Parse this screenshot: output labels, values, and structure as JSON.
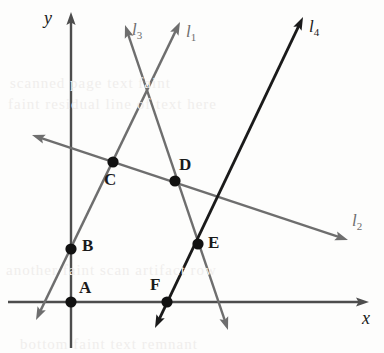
{
  "figure": {
    "width": 384,
    "height": 353,
    "background": "#fdfdfc"
  },
  "colors": {
    "axis": "#4d4d4d",
    "gray_line": "#6e6e6e",
    "black_line": "#1a1a1a",
    "point_fill": "#111111",
    "label_text": "#1a1a1a",
    "gray_label_text": "#6e6e6e",
    "background_noise": "#f0eeec"
  },
  "axes": {
    "x": {
      "label": "x",
      "label_x": 362,
      "label_y": 308,
      "y_pixel": 302,
      "x_start": 8,
      "x_end": 369
    },
    "y": {
      "label": "y",
      "label_x": 44,
      "label_y": 8,
      "x_pixel": 71,
      "y_start": 12,
      "y_end": 348
    }
  },
  "points": [
    {
      "name": "A",
      "cx": 71,
      "cy": 302,
      "label": "A",
      "label_x": 79,
      "label_y": 278
    },
    {
      "name": "B",
      "cx": 71,
      "cy": 249,
      "label": "B",
      "label_x": 82,
      "label_y": 236
    },
    {
      "name": "C",
      "cx": 113,
      "cy": 162,
      "label": "C",
      "label_x": 104,
      "label_y": 170
    },
    {
      "name": "D",
      "cx": 175,
      "cy": 181,
      "label": "D",
      "label_x": 179,
      "label_y": 155
    },
    {
      "name": "E",
      "cx": 198,
      "cy": 244,
      "label": "E",
      "label_x": 208,
      "label_y": 233
    },
    {
      "name": "F",
      "cx": 167,
      "cy": 302,
      "label": "F",
      "label_x": 150,
      "label_y": 275
    }
  ],
  "lines": [
    {
      "name": "l1",
      "label": "l",
      "subscript": "1",
      "color": "#6e6e6e",
      "style": "gray",
      "arrows": "both",
      "x1": 36,
      "y1": 320,
      "x2": 180,
      "y2": 22,
      "label_x": 186,
      "label_y": 22,
      "passes_through": [
        "A",
        "B",
        "C"
      ]
    },
    {
      "name": "l2",
      "label": "l",
      "subscript": "2",
      "color": "#6e6e6e",
      "style": "gray",
      "arrows": "both",
      "x1": 32,
      "y1": 135,
      "x2": 348,
      "y2": 240,
      "label_x": 352,
      "label_y": 211,
      "passes_through": [
        "C",
        "D"
      ]
    },
    {
      "name": "l3",
      "label": "l",
      "subscript": "3",
      "color": "#6e6e6e",
      "style": "gray",
      "arrows": "both",
      "x1": 125,
      "y1": 25,
      "x2": 228,
      "y2": 330,
      "label_x": 132,
      "label_y": 20,
      "passes_through": [
        "D",
        "E"
      ]
    },
    {
      "name": "l4",
      "label": "l",
      "subscript": "4",
      "color": "#1a1a1a",
      "style": "black",
      "arrows": "both",
      "x1": 155,
      "y1": 328,
      "x2": 303,
      "y2": 17,
      "label_x": 309,
      "label_y": 17,
      "passes_through": [
        "E",
        "F"
      ]
    }
  ],
  "background_artifacts": [
    {
      "text": "scanned page text faint",
      "x": 10,
      "y": 75
    },
    {
      "text": "faint residual line of text here",
      "x": 8,
      "y": 96
    },
    {
      "text": "another faint scan artifact row",
      "x": 6,
      "y": 262
    },
    {
      "text": "bottom faint text remnant",
      "x": 20,
      "y": 336
    }
  ]
}
